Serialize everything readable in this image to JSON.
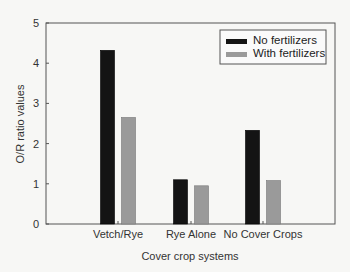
{
  "chart_data": {
    "type": "bar",
    "title": "",
    "xlabel": "Cover crop systems",
    "ylabel": "O/R ratio values",
    "categories": [
      "Vetch/Rye",
      "Rye Alone",
      "No Cover Crops"
    ],
    "series": [
      {
        "name": "No fertilizers",
        "color": "#141414",
        "values": [
          4.32,
          1.1,
          2.33
        ]
      },
      {
        "name": "With fertilizers",
        "color": "#9a9a9a",
        "values": [
          2.65,
          0.95,
          1.08
        ]
      }
    ],
    "ylim": [
      0,
      5
    ],
    "yticks": [
      0,
      1,
      2,
      3,
      4,
      5
    ],
    "grid": false,
    "legend_position": "upper right"
  }
}
